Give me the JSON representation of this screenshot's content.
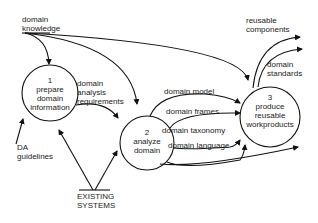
{
  "diagram": {
    "type": "data-flow-diagram",
    "processes": [
      {
        "id": "1",
        "number": "1",
        "line1": "prepare",
        "line2": "domain",
        "line3": "information"
      },
      {
        "id": "2",
        "number": "2",
        "line1": "analyze",
        "line2": "domain"
      },
      {
        "id": "3",
        "number": "3",
        "line1": "produce",
        "line2": "reusable",
        "line3": "workproducts"
      }
    ],
    "inputs": {
      "domain_knowledge": {
        "line1": "domain",
        "line2": "knowledge"
      },
      "da_guidelines": {
        "line1": "DA",
        "line2": "guidelines"
      },
      "existing_systems": {
        "line1": "EXISTING",
        "line2": "SYSTEMS"
      }
    },
    "flows": {
      "domain_analysis_requirements": {
        "line1": "domain",
        "line2": "analysis",
        "line3": "requirements"
      },
      "domain_model": "domain  model",
      "domain_frames": "domain  frames",
      "domain_taxonomy": "domain  taxonomy",
      "domain_language": "domain  language"
    },
    "outputs": {
      "reusable_components": {
        "line1": "reusable",
        "line2": "components"
      },
      "domain_standards": {
        "line1": "domain",
        "line2": "standards"
      }
    }
  }
}
